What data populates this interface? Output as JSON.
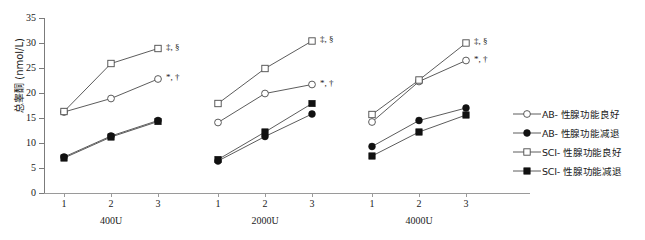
{
  "chart_data": {
    "type": "line",
    "title": "",
    "xlabel": "",
    "ylabel": "总睾酮 (nmol/L)",
    "ylim": [
      0,
      35
    ],
    "ytick_labels": [
      "0",
      "5",
      "10",
      "15",
      "20",
      "25",
      "30",
      "35"
    ],
    "ytick_values": [
      0,
      5,
      10,
      15,
      20,
      25,
      30,
      35
    ],
    "grid": false,
    "legend_position": "right",
    "groups": [
      {
        "label": "400U",
        "x_tick_labels": [
          "1",
          "2",
          "3"
        ]
      },
      {
        "label": "2000U",
        "x_tick_labels": [
          "1",
          "2",
          "3"
        ]
      },
      {
        "label": "4000U",
        "x_tick_labels": [
          "1",
          "2",
          "3"
        ]
      }
    ],
    "x": [
      1,
      2,
      3
    ],
    "series": [
      {
        "name": "AB- 性腺功能良好",
        "marker": "open-circle",
        "values_400U": [
          16.2,
          18.9,
          22.8
        ],
        "values_2000U": [
          14.1,
          19.9,
          21.7
        ],
        "values_4000U": [
          14.2,
          22.3,
          26.5
        ],
        "annotation": "*, †"
      },
      {
        "name": "AB- 性腺功能减退",
        "marker": "filled-circle",
        "values_400U": [
          7.2,
          11.4,
          14.5
        ],
        "values_2000U": [
          6.4,
          11.3,
          15.8
        ],
        "values_4000U": [
          9.3,
          14.5,
          17.0
        ],
        "annotation": ""
      },
      {
        "name": "SCI- 性腺功能良好",
        "marker": "open-square",
        "values_400U": [
          16.3,
          25.9,
          28.9
        ],
        "values_2000U": [
          17.9,
          24.9,
          30.4
        ],
        "values_4000U": [
          15.7,
          22.6,
          30.0
        ],
        "annotation": "‡, §"
      },
      {
        "name": "SCI- 性腺功能减退",
        "marker": "filled-square",
        "values_400U": [
          7.0,
          11.2,
          14.3
        ],
        "values_2000U": [
          6.7,
          12.2,
          17.9
        ],
        "values_4000U": [
          7.4,
          12.2,
          15.6
        ],
        "annotation": ""
      }
    ],
    "annotations": [
      {
        "group": "400U",
        "text": "‡, §",
        "series": "SCI- 性腺功能良好"
      },
      {
        "group": "400U",
        "text": "*, †",
        "series": "AB- 性腺功能良好"
      },
      {
        "group": "2000U",
        "text": "‡, §",
        "series": "SCI- 性腺功能良好"
      },
      {
        "group": "2000U",
        "text": "*, †",
        "series": "AB- 性腺功能良好"
      },
      {
        "group": "4000U",
        "text": "‡, §",
        "series": "SCI- 性腺功能良好"
      },
      {
        "group": "4000U",
        "text": "*, †",
        "series": "AB- 性腺功能良好"
      }
    ]
  },
  "legend": {
    "items": [
      {
        "label": "AB- 性腺功能良好",
        "marker": "open-circle"
      },
      {
        "label": "AB- 性腺功能减退",
        "marker": "filled-circle"
      },
      {
        "label": "SCI- 性腺功能良好",
        "marker": "open-square"
      },
      {
        "label": "SCI- 性腺功能减退",
        "marker": "filled-square"
      }
    ]
  },
  "colors": {
    "line": "#4a4a4a",
    "axis": "#8a8a8a",
    "text": "#1a1a1a",
    "marker_fill": "#111111",
    "marker_open": "#ffffff"
  }
}
